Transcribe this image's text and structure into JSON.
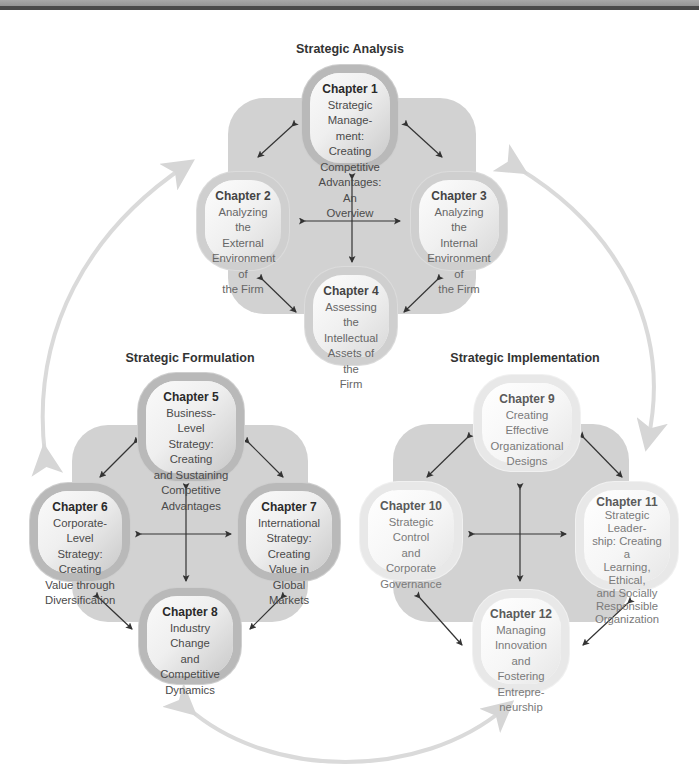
{
  "sections": {
    "analysis": {
      "title": "Strategic Analysis"
    },
    "formulation": {
      "title": "Strategic Formulation"
    },
    "implementation": {
      "title": "Strategic Implementation"
    }
  },
  "chapters": [
    {
      "label": "Chapter 1",
      "title": "Strategic Management: Creating Competitive Advantages: An Overview",
      "lines": [
        "Strategic Manage-",
        "ment: Creating",
        "Competitive",
        "Advantages: An",
        "Overview"
      ]
    },
    {
      "label": "Chapter 2",
      "title": "Analyzing the External Environment of the Firm",
      "lines": [
        "Analyzing the",
        "External",
        "Environment of",
        "the Firm"
      ]
    },
    {
      "label": "Chapter 3",
      "title": "Analyzing the Internal Environment of the Firm",
      "lines": [
        "Analyzing the",
        "Internal",
        "Environment of",
        "the Firm"
      ]
    },
    {
      "label": "Chapter 4",
      "title": "Assessing the Intellectual Assets of the Firm",
      "lines": [
        "Assessing the",
        "Intellectual",
        "Assets of the",
        "Firm"
      ]
    },
    {
      "label": "Chapter 5",
      "title": "Business-Level Strategy: Creating and Sustaining Competitive Advantages",
      "lines": [
        "Business-Level",
        "Strategy: Creating",
        "and Sustaining",
        "Competitive",
        "Advantages"
      ]
    },
    {
      "label": "Chapter 6",
      "title": "Corporate-Level Strategy: Creating Value through Diversification",
      "lines": [
        "Corporate-Level",
        "Strategy: Creating",
        "Value through",
        "Diversification"
      ]
    },
    {
      "label": "Chapter 7",
      "title": "International Strategy: Creating Value in Global Markets",
      "lines": [
        "International",
        "Strategy: Creating",
        "Value in Global",
        "Markets"
      ]
    },
    {
      "label": "Chapter 8",
      "title": "Industry Change and Competitive Dynamics",
      "lines": [
        "Industry Change",
        "and Competitive",
        "Dynamics"
      ]
    },
    {
      "label": "Chapter 9",
      "title": "Creating Effective Organizational Designs",
      "lines": [
        "Creating Effective",
        "Organizational",
        "Designs"
      ]
    },
    {
      "label": "Chapter 10",
      "title": "Strategic Control and Corporate Governance",
      "lines": [
        "Strategic Control",
        "and Corporate",
        "Governance"
      ]
    },
    {
      "label": "Chapter 11",
      "title": "Strategic Leadership: Creating a Learning, Ethical, and Socially Responsible Organization",
      "lines": [
        "Strategic Leader-",
        "ship: Creating a",
        "Learning, Ethical,",
        "and Socially",
        "Responsible",
        "Organization"
      ]
    },
    {
      "label": "Chapter 12",
      "title": "Managing Innovation and Fostering Entrepreneurship",
      "lines": [
        "Managing",
        "Innovation and",
        "Fostering Entrepre-",
        "neurship"
      ]
    }
  ],
  "colors": {
    "cross_bg": "#d2d2d2",
    "cycle_arrow": "#d9d9d9",
    "connector_arrow": "#333333",
    "title_text": "#333333"
  }
}
